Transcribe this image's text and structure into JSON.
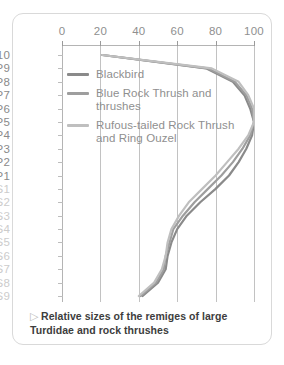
{
  "caption": {
    "marker": "▷",
    "text": "Relative sizes of the remiges of large Turdidae and rock thrushes"
  },
  "legend": [
    {
      "label": "Blackbird",
      "color": "#8a8a8a"
    },
    {
      "label": "Blue Rock Thrush and thrushes",
      "color": "#9e9e9e"
    },
    {
      "label": "Rufous-tailed Rock Thrush and Ring Ouzel",
      "color": "#bfbfbf"
    }
  ],
  "colors": {
    "card_border": "#d9d9d9",
    "gridline": "#c2c2c2",
    "axis": "#b4b4b4",
    "label_primary": "#8a8a8a",
    "label_secondary": "#cccccc",
    "caption_text": "#3d3d3d"
  },
  "chart_data": {
    "type": "line",
    "title": "Relative sizes of the remiges of large Turdidae and rock thrushes",
    "xlabel": "",
    "ylabel": "",
    "xlim": [
      0,
      100
    ],
    "xticks": [
      0,
      20,
      40,
      60,
      80,
      100
    ],
    "xtick_labels": [
      "0",
      "20",
      "40",
      "60",
      "80",
      "100"
    ],
    "grid": true,
    "legend_position": "inside-top-left",
    "orientation": "horizontal-value-vertical-category",
    "categories": [
      "P10",
      "P9",
      "P8",
      "P7",
      "P6",
      "P5",
      "P4",
      "P3",
      "P2",
      "P1",
      "S1",
      "S2",
      "S3",
      "S4",
      "S5",
      "S6",
      "S7",
      "S8",
      "S9"
    ],
    "category_groups": [
      {
        "name": "primaries",
        "labels": [
          "P10",
          "P9",
          "P8",
          "P7",
          "P6",
          "P5",
          "P4",
          "P3",
          "P2",
          "P1"
        ],
        "emphasis": "primary"
      },
      {
        "name": "secondaries",
        "labels": [
          "S1",
          "S2",
          "S3",
          "S4",
          "S5",
          "S6",
          "S7",
          "S8",
          "S9"
        ],
        "emphasis": "secondary"
      }
    ],
    "series": [
      {
        "name": "Blackbird",
        "color": "#8a8a8a",
        "values": [
          21,
          75,
          89,
          95,
          98,
          100,
          99,
          96,
          92,
          87,
          80,
          72,
          65,
          60,
          57,
          55,
          54,
          50,
          42
        ]
      },
      {
        "name": "Blue Rock Thrush and thrushes",
        "color": "#9e9e9e",
        "values": [
          21,
          76,
          90,
          96,
          99,
          100,
          98,
          94,
          89,
          83,
          76,
          69,
          63,
          58,
          56,
          54,
          53,
          49,
          41
        ]
      },
      {
        "name": "Rufous-tailed Rock Thrush and Ring Ouzel",
        "color": "#bfbfbf",
        "values": [
          21,
          78,
          92,
          97,
          100,
          100,
          97,
          92,
          86,
          80,
          73,
          66,
          61,
          57,
          55,
          54,
          52,
          48,
          40
        ]
      }
    ]
  }
}
